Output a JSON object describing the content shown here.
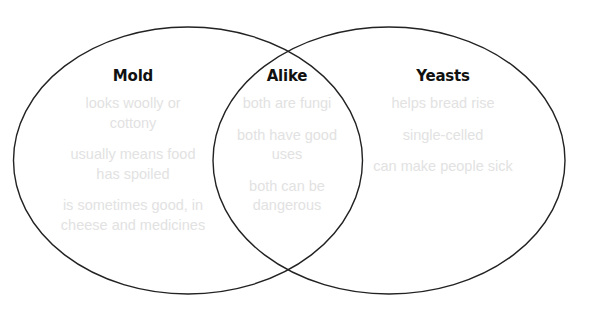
{
  "diagram": {
    "type": "venn",
    "colors": {
      "outline": "#222222",
      "title_text": "#111111",
      "item_text": "#e2e2e2",
      "background": "#ffffff"
    },
    "sets": [
      {
        "id": "mold",
        "title": "Mold",
        "items": [
          "looks woolly or\ncottony",
          "usually means food\nhas spoiled",
          "is sometimes good, in\ncheese and medicines"
        ]
      },
      {
        "id": "alike",
        "title": "Alike",
        "items": [
          "both are fungi",
          "both have good\nuses",
          "both can be\ndangerous"
        ]
      },
      {
        "id": "yeasts",
        "title": "Yeasts",
        "items": [
          "helps bread rise",
          "single-celled",
          "can make people sick"
        ]
      }
    ]
  }
}
